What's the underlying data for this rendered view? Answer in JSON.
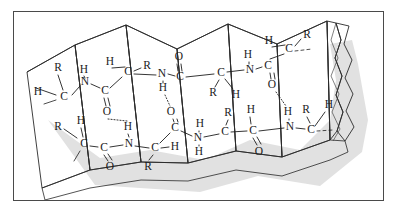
{
  "figure": {
    "name": "beta-pleated-sheet",
    "frame": {
      "x": 13,
      "y": 11,
      "width": 371,
      "height": 190,
      "border_color": "#4a4a4a",
      "background_color": "#ffffff"
    },
    "colors": {
      "facet_light": "#f0f0f0",
      "facet_dark": "#b8b8b8",
      "facet_mid": "#d4d4d4",
      "edge": "#2a2a2a",
      "atom_text": "#1b1b1b",
      "shadow": "#c9c9c9",
      "bond": "#1f1f1f"
    },
    "sheet": {
      "pleat_count": 7,
      "edge_style": "torn",
      "shadow": true
    }
  },
  "chains": [
    {
      "name": "upper-chain",
      "direction": "left-to-right",
      "atoms": [
        {
          "id": "u1",
          "label": "H",
          "x": 38,
          "y": 92
        },
        {
          "id": "u2",
          "label": "R",
          "x": 58,
          "y": 68
        },
        {
          "id": "u3",
          "label": "C",
          "x": 64,
          "y": 97
        },
        {
          "id": "u4",
          "label": "H",
          "x": 84,
          "y": 70
        },
        {
          "id": "u5",
          "label": "N",
          "x": 85,
          "y": 82
        },
        {
          "id": "u6",
          "label": "C",
          "x": 105,
          "y": 91
        },
        {
          "id": "u7",
          "label": "O",
          "x": 107,
          "y": 112
        },
        {
          "id": "u8",
          "label": "H",
          "x": 110,
          "y": 62
        },
        {
          "id": "u9",
          "label": "C",
          "x": 128,
          "y": 72
        },
        {
          "id": "u10",
          "label": "R",
          "x": 147,
          "y": 66
        },
        {
          "id": "u11",
          "label": "N",
          "x": 162,
          "y": 74
        },
        {
          "id": "u12",
          "label": "O",
          "x": 179,
          "y": 57
        },
        {
          "id": "u13",
          "label": "C",
          "x": 180,
          "y": 77
        },
        {
          "id": "u14",
          "label": "H",
          "x": 163,
          "y": 88
        },
        {
          "id": "u15",
          "label": "C",
          "x": 221,
          "y": 73
        },
        {
          "id": "u16",
          "label": "R",
          "x": 213,
          "y": 93
        },
        {
          "id": "u17",
          "label": "H",
          "x": 236,
          "y": 95
        },
        {
          "id": "u18",
          "label": "N",
          "x": 250,
          "y": 70
        },
        {
          "id": "u19",
          "label": "H",
          "x": 248,
          "y": 55
        },
        {
          "id": "u20",
          "label": "C",
          "x": 268,
          "y": 66
        },
        {
          "id": "u21",
          "label": "O",
          "x": 272,
          "y": 85
        },
        {
          "id": "u22",
          "label": "C",
          "x": 289,
          "y": 49
        },
        {
          "id": "u23",
          "label": "H",
          "x": 269,
          "y": 41
        },
        {
          "id": "u24",
          "label": "R",
          "x": 307,
          "y": 35
        }
      ]
    },
    {
      "name": "lower-chain",
      "direction": "left-to-right",
      "atoms": [
        {
          "id": "l1",
          "label": "R",
          "x": 58,
          "y": 127
        },
        {
          "id": "l2",
          "label": "H",
          "x": 81,
          "y": 121
        },
        {
          "id": "l3",
          "label": "C",
          "x": 84,
          "y": 144
        },
        {
          "id": "l4",
          "label": "C",
          "x": 104,
          "y": 148
        },
        {
          "id": "l5",
          "label": "O",
          "x": 110,
          "y": 167
        },
        {
          "id": "l6",
          "label": "N",
          "x": 129,
          "y": 144
        },
        {
          "id": "l7",
          "label": "H",
          "x": 128,
          "y": 127
        },
        {
          "id": "l8",
          "label": "C",
          "x": 155,
          "y": 148
        },
        {
          "id": "l9",
          "label": "H",
          "x": 175,
          "y": 147
        },
        {
          "id": "l10",
          "label": "R",
          "x": 148,
          "y": 167
        },
        {
          "id": "l11",
          "label": "O",
          "x": 171,
          "y": 112
        },
        {
          "id": "l12",
          "label": "C",
          "x": 175,
          "y": 128
        },
        {
          "id": "l13",
          "label": "N",
          "x": 198,
          "y": 138
        },
        {
          "id": "l14",
          "label": "H",
          "x": 200,
          "y": 124
        },
        {
          "id": "l15",
          "label": "H",
          "x": 199,
          "y": 152
        },
        {
          "id": "l16",
          "label": "C",
          "x": 225,
          "y": 132
        },
        {
          "id": "l17",
          "label": "R",
          "x": 228,
          "y": 113
        },
        {
          "id": "l18",
          "label": "H",
          "x": 251,
          "y": 110
        },
        {
          "id": "l19",
          "label": "C",
          "x": 253,
          "y": 131
        },
        {
          "id": "l20",
          "label": "O",
          "x": 259,
          "y": 152
        },
        {
          "id": "l21",
          "label": "N",
          "x": 290,
          "y": 127
        },
        {
          "id": "l22",
          "label": "H",
          "x": 288,
          "y": 112
        },
        {
          "id": "l23",
          "label": "R",
          "x": 306,
          "y": 110
        },
        {
          "id": "l24",
          "label": "C",
          "x": 311,
          "y": 130
        },
        {
          "id": "l25",
          "label": "H",
          "x": 329,
          "y": 105
        }
      ]
    }
  ],
  "hydrogen_bonds": [
    {
      "name": "hbond-1",
      "from": "u7",
      "to": "l7"
    },
    {
      "name": "hbond-2",
      "from": "u14",
      "to": "l11"
    },
    {
      "name": "hbond-3",
      "from": "u21",
      "to": "l22"
    }
  ]
}
